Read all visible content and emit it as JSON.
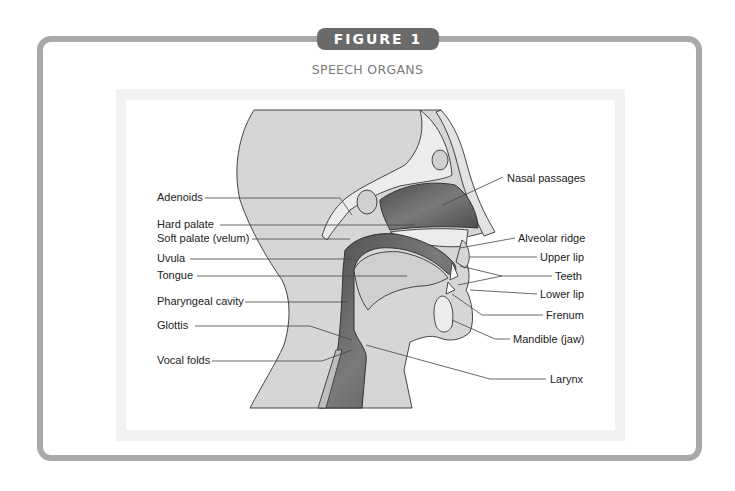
{
  "figure": {
    "badge": "FIGURE 1",
    "title": "SPEECH ORGANS"
  },
  "labels": {
    "left": [
      {
        "text": "Adenoids",
        "x": 157,
        "y": 201
      },
      {
        "text": "Hard palate",
        "x": 157,
        "y": 228
      },
      {
        "text": "Soft palate (velum)",
        "x": 157,
        "y": 242
      },
      {
        "text": "Uvula",
        "x": 157,
        "y": 262
      },
      {
        "text": "Tongue",
        "x": 157,
        "y": 279
      },
      {
        "text": "Pharyngeal cavity",
        "x": 157,
        "y": 305
      },
      {
        "text": "Glottis",
        "x": 157,
        "y": 329
      },
      {
        "text": "Vocal folds",
        "x": 157,
        "y": 364
      }
    ],
    "right": [
      {
        "text": "Nasal passages",
        "x": 507,
        "y": 182
      },
      {
        "text": "Alveolar ridge",
        "x": 518,
        "y": 242
      },
      {
        "text": "Upper lip",
        "x": 540,
        "y": 261
      },
      {
        "text": "Teeth",
        "x": 555,
        "y": 280
      },
      {
        "text": "Lower lip",
        "x": 540,
        "y": 298
      },
      {
        "text": "Frenum",
        "x": 546,
        "y": 319
      },
      {
        "text": "Mandible (jaw)",
        "x": 513,
        "y": 343
      },
      {
        "text": "Larynx",
        "x": 550,
        "y": 383
      }
    ]
  },
  "colors": {
    "frame_border": "#a9a9a9",
    "badge_bg": "#6a6a6a",
    "subtitle": "#7a7a7a",
    "head_fill": "#d6d6d6",
    "bone_fill": "#e9e9e9",
    "cavity_fill": "#5e5e5e",
    "outline": "#444444"
  }
}
